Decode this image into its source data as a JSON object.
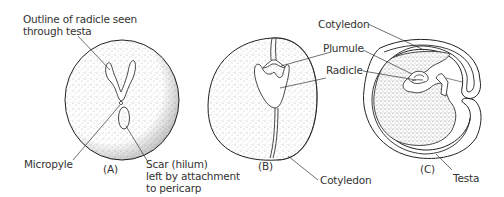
{
  "figure": {
    "panels": [
      {
        "id": "A",
        "caption": "(A)",
        "labels": {
          "radicle_outline": "Outline of radicle seen\nthrough testa",
          "micropyle": "Micropyle",
          "scar": "Scar (hilum)\nleft by attachment\nto pericarp"
        }
      },
      {
        "id": "B",
        "caption": "(B)",
        "labels": {
          "cotyledon": "Cotyledon"
        }
      },
      {
        "id": "C",
        "caption": "(C)",
        "labels": {
          "cotyledon": "Cotyledon",
          "plumule": "Plumule",
          "radicle": "Radicle",
          "testa": "Testa"
        }
      }
    ],
    "colors": {
      "ink": "#222222",
      "stipple": "#555555",
      "text": "#333333",
      "background": "#ffffff"
    }
  }
}
